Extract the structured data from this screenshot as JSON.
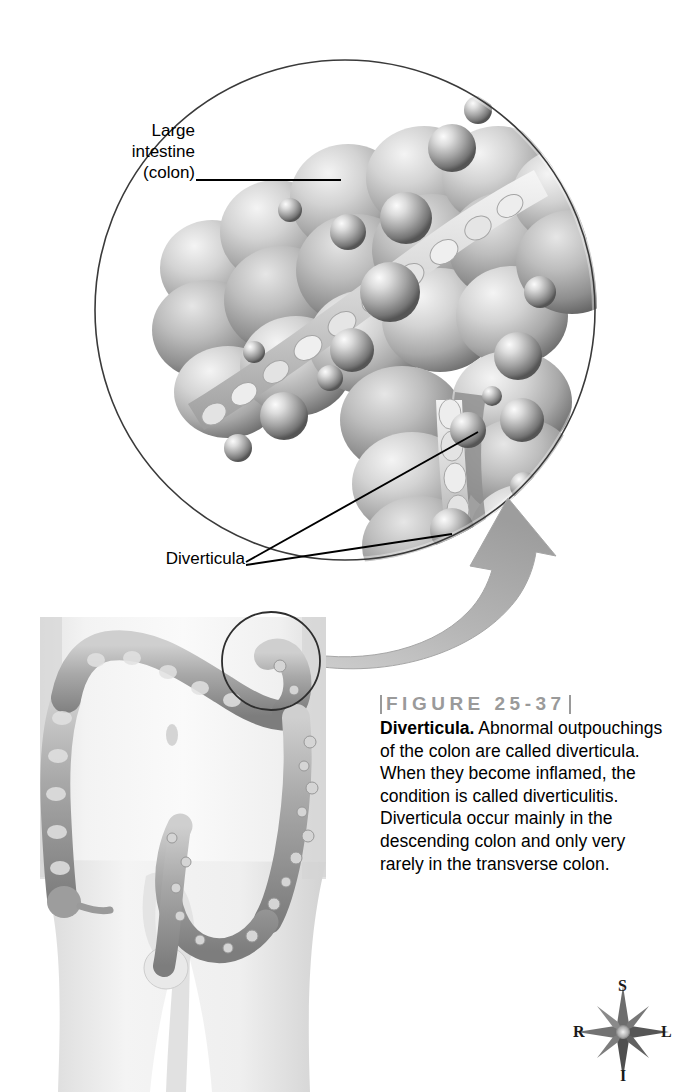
{
  "figure": {
    "number_label": "FIGURE  25-37",
    "term": "Diverticula.",
    "caption": " Abnormal outpouchings of the colon are called diverticula. When they become inflamed, the condition is called diverticulitis. Diverticula occur mainly in the descending colon and only very rarely in the transverse colon.",
    "caption_full": "Diverticula. Abnormal outpouchings of the colon are called diverticula. When they become inflamed, the condition is called diverticulitis. Diverticula occur mainly in the descending colon and only very rarely in the transverse colon."
  },
  "labels": {
    "large_intestine": "Large\nintestine\n(colon)",
    "large_intestine_flat": "Large intestine (colon)",
    "diverticula": "Diverticula"
  },
  "compass": {
    "superior": "S",
    "inferior": "I",
    "right": "R",
    "left": "L"
  },
  "colors": {
    "background": "#ffffff",
    "line": "#000000",
    "figure_head_gray": "#9a9a9a",
    "tissue_light": "#e8e8e8",
    "tissue_mid": "#b4b4b4",
    "tissue_dark": "#828282",
    "tissue_shadow": "#5e5e5e",
    "skin_light": "#f2f2f2",
    "skin_shade": "#dcdcdc",
    "arrow_gray": "#b0b0b0",
    "text": "#000000"
  },
  "illustration": {
    "inset_circle": {
      "name": "magnified-colon-detail",
      "center_x": 345,
      "center_y": 310,
      "radius": 250
    },
    "body_diagram": {
      "name": "anterior-torso-with-colon",
      "structures": [
        "ascending colon",
        "transverse colon",
        "descending colon",
        "sigmoid colon",
        "rectum",
        "cecum",
        "appendix"
      ]
    },
    "magnifier_arrow": {
      "name": "magnification-arrow",
      "from": "descending colon region of torso",
      "to": "inset detail circle"
    }
  }
}
